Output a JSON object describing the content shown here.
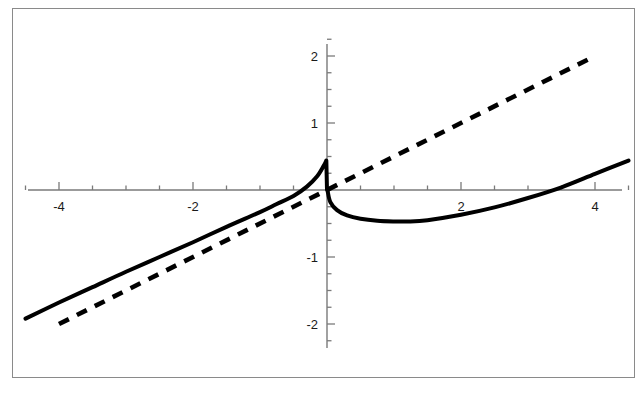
{
  "figure": {
    "name": "function-plot",
    "background": "#ffffff",
    "frame_color": "#8a8a8a",
    "axis_color": "#7a7a7a",
    "curve_color": "#000000"
  },
  "chart_data": {
    "type": "line",
    "title": "",
    "subtitle": "",
    "xlabel": "",
    "ylabel": "",
    "xlim": [
      -4.7,
      4.7
    ],
    "ylim": [
      -2.3,
      2.3
    ],
    "grid": false,
    "legend": "none",
    "axes_style": "centered-cross",
    "x_major_ticks": [
      -4,
      -2,
      2,
      4
    ],
    "x_major_tick_labels": [
      "-4",
      "-2",
      "2",
      "4"
    ],
    "x_minor_tick_step": 0.5,
    "y_major_ticks": [
      -2,
      -1,
      1,
      2
    ],
    "y_major_tick_labels": [
      "-2",
      "-1",
      "1",
      "2"
    ],
    "y_minor_tick_step": 0.25,
    "series": [
      {
        "name": "dashed-line",
        "style": "dashed",
        "color": "#000000",
        "width": 4,
        "dash": "11 9",
        "description": "straight line y = x/2",
        "x": [
          -4.0,
          -3.0,
          -2.0,
          -1.0,
          0.0,
          1.0,
          2.0,
          3.0,
          4.0
        ],
        "values": [
          -2.0,
          -1.5,
          -1.0,
          -0.5,
          0.0,
          0.5,
          1.0,
          1.5,
          2.0
        ]
      },
      {
        "name": "solid-curve",
        "style": "solid",
        "color": "#000000",
        "width": 4,
        "description": "curve with sharp drop at origin: rises to local max just left of x=0, discontinuous plunge through origin, local min near x=1.2, then rises",
        "x": [
          -4.5,
          -4.0,
          -3.5,
          -3.0,
          -2.5,
          -2.0,
          -1.5,
          -1.0,
          -0.75,
          -0.5,
          -0.3,
          -0.15,
          -0.05,
          -0.01,
          0.0,
          0.01,
          0.05,
          0.15,
          0.3,
          0.5,
          0.75,
          1.0,
          1.2,
          1.5,
          2.0,
          2.5,
          3.0,
          3.5,
          4.0,
          4.5
        ],
        "values": [
          -1.92,
          -1.68,
          -1.45,
          -1.22,
          -1.0,
          -0.78,
          -0.55,
          -0.33,
          -0.21,
          -0.09,
          0.05,
          0.2,
          0.36,
          0.44,
          0.45,
          -0.02,
          -0.18,
          -0.3,
          -0.38,
          -0.43,
          -0.46,
          -0.47,
          -0.47,
          -0.45,
          -0.37,
          -0.26,
          -0.12,
          0.04,
          0.24,
          0.44
        ]
      }
    ],
    "annotations": []
  },
  "axis_labels": {
    "x": [
      {
        "text": "-4",
        "value": -4
      },
      {
        "text": "-2",
        "value": -2
      },
      {
        "text": "2",
        "value": 2
      },
      {
        "text": "4",
        "value": 4
      }
    ],
    "y": [
      {
        "text": "2",
        "value": 2
      },
      {
        "text": "1",
        "value": 1
      },
      {
        "text": "-1",
        "value": -1
      },
      {
        "text": "-2",
        "value": -2
      }
    ]
  }
}
